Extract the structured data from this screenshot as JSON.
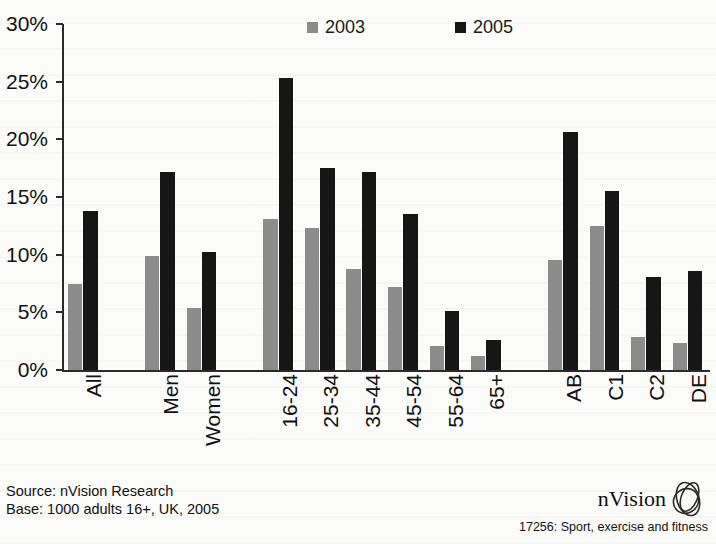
{
  "chart_data": {
    "type": "bar",
    "title": "",
    "xlabel": "",
    "ylabel": "",
    "ylim": [
      0,
      30
    ],
    "ytick_labels": [
      "0%",
      "5%",
      "10%",
      "15%",
      "20%",
      "25%",
      "30%"
    ],
    "ytick_values": [
      0,
      5,
      10,
      15,
      20,
      25,
      30
    ],
    "grid": false,
    "legend_position": "top-center",
    "categories": [
      "All",
      "Men",
      "Women",
      "16-24",
      "25-34",
      "35-44",
      "45-54",
      "55-64",
      "65+",
      "AB",
      "C1",
      "C2",
      "DE"
    ],
    "group_breaks": [
      1,
      3,
      9
    ],
    "series": [
      {
        "name": "2003",
        "color": "#8c8c8c",
        "values": [
          7.5,
          9.9,
          5.4,
          13.1,
          12.3,
          8.8,
          7.2,
          2.1,
          1.2,
          9.5,
          12.5,
          2.9,
          2.3
        ]
      },
      {
        "name": "2005",
        "color": "#161616",
        "values": [
          13.8,
          17.2,
          10.2,
          25.3,
          17.5,
          17.2,
          13.5,
          5.1,
          2.6,
          20.6,
          15.5,
          8.1,
          8.6
        ]
      }
    ]
  },
  "legend": {
    "entries": [
      {
        "label": "2003",
        "swatch": "legend-swatch-2003"
      },
      {
        "label": "2005",
        "swatch": "legend-swatch-2005"
      }
    ]
  },
  "footer": {
    "source_line": "Source: nVision Research",
    "base_line": "Base: 1000 adults 16+, UK, 2005",
    "brand_name": "nVision",
    "brand_caption": "17256: Sport, exercise and fitness",
    "brand_mark_icon": "nvision-ellipse-logo-icon"
  },
  "colors": {
    "series_2003": "#8c8c8c",
    "series_2005": "#161616",
    "axis": "#2a2a2a",
    "background": "#fbfbf9"
  }
}
